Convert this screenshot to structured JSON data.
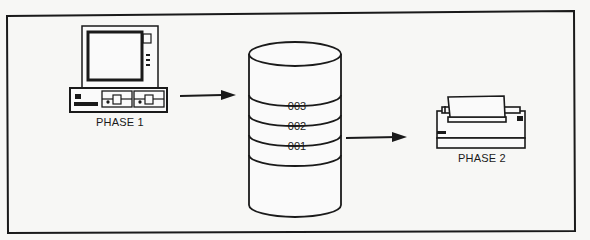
{
  "diagram": {
    "title": "",
    "nodes": {
      "phase1": {
        "label": "PHASE 1",
        "icon": "desktop-computer-icon"
      },
      "storage": {
        "icon": "database-cylinder-icon",
        "segments": [
          "003",
          "002",
          "001"
        ]
      },
      "phase2": {
        "label": "PHASE 2",
        "icon": "printer-icon"
      }
    },
    "edges": [
      {
        "from": "phase1",
        "to": "storage",
        "type": "arrow"
      },
      {
        "from": "storage",
        "to": "phase2",
        "type": "arrow"
      }
    ],
    "colors": {
      "ink": "#1a1a1a",
      "paper": "#f7f7f5"
    }
  }
}
